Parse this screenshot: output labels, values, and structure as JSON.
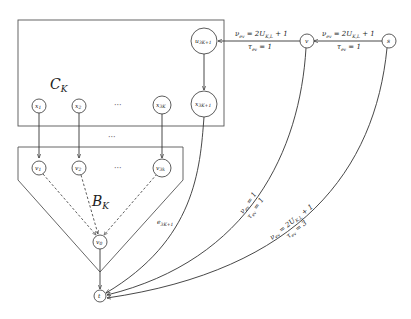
{
  "diagram": {
    "groups": {
      "C_K": {
        "label": "C",
        "sub": "K"
      },
      "B_K": {
        "label": "B",
        "sub": "K"
      }
    },
    "nodes": {
      "x1": {
        "label": "x",
        "sub": "1"
      },
      "x2": {
        "label": "x",
        "sub": "2"
      },
      "x3K": {
        "label": "x",
        "sub": "3K"
      },
      "u3K1": {
        "label": "u",
        "sub": "3K+1"
      },
      "x3K1": {
        "label": "x",
        "sub": "3K+1"
      },
      "v1": {
        "label": "v",
        "sub": "1"
      },
      "v2": {
        "label": "v",
        "sub": "2"
      },
      "v3k": {
        "label": "v",
        "sub": "3k"
      },
      "v0": {
        "label": "v",
        "sub": "0"
      },
      "t": {
        "label": "t"
      },
      "v": {
        "label": "v"
      },
      "s": {
        "label": "s"
      }
    },
    "ellipsis": "···",
    "edges": {
      "v_to_u": {
        "nu": "ν_ev = 2U_{K,L} + 1",
        "tau": "τ_ev = 1"
      },
      "s_to_v": {
        "nu": "ν_ev = 2U_{K,L} + 1",
        "tau": "τ_ev = 1"
      },
      "v_to_t": {
        "nu": "ν_ev = 1",
        "tau": "τ_ev = 1"
      },
      "s_to_t": {
        "nu": "ν_ev = 2U_{K,L} + 1",
        "tau": "τ_ev = 3"
      },
      "x3K1_to_t": {
        "label": "e",
        "sub": "3K+1"
      }
    },
    "text": {
      "nu_top1": "ν",
      "ev": "ev",
      "eq_2U": " = 2U",
      "KL": "K,L",
      "plus1": " + 1",
      "tau": "τ",
      "eq1": " = 1",
      "eq3": " = 3"
    }
  }
}
